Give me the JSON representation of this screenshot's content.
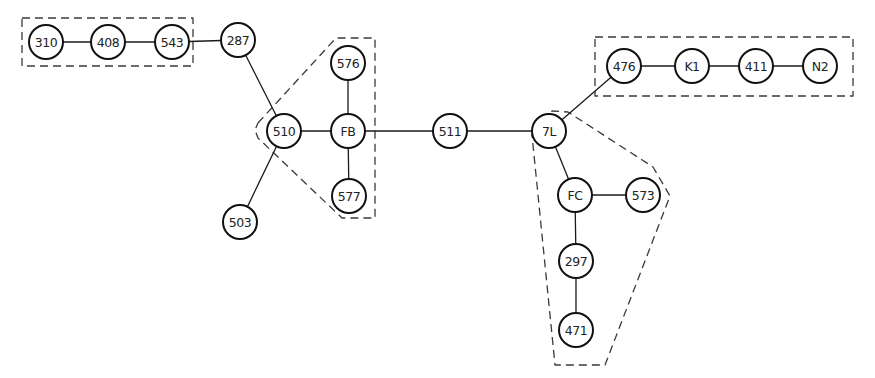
{
  "diagram": {
    "type": "network-graph",
    "node_radius": 17,
    "nodes": [
      {
        "id": "310",
        "label": "310",
        "x": 46,
        "y": 42
      },
      {
        "id": "408",
        "label": "408",
        "x": 108,
        "y": 42
      },
      {
        "id": "543",
        "label": "543",
        "x": 172,
        "y": 42
      },
      {
        "id": "287",
        "label": "287",
        "x": 238,
        "y": 40
      },
      {
        "id": "510",
        "label": "510",
        "x": 284,
        "y": 131
      },
      {
        "id": "503",
        "label": "503",
        "x": 240,
        "y": 222
      },
      {
        "id": "FB",
        "label": "FB",
        "x": 348,
        "y": 131
      },
      {
        "id": "576",
        "label": "576",
        "x": 348,
        "y": 63
      },
      {
        "id": "577",
        "label": "577",
        "x": 349,
        "y": 196
      },
      {
        "id": "511",
        "label": "511",
        "x": 450,
        "y": 131
      },
      {
        "id": "7L",
        "label": "7L",
        "x": 549,
        "y": 131
      },
      {
        "id": "476",
        "label": "476",
        "x": 624,
        "y": 66
      },
      {
        "id": "K1",
        "label": "K1",
        "x": 692,
        "y": 66
      },
      {
        "id": "411",
        "label": "411",
        "x": 756,
        "y": 66
      },
      {
        "id": "N2",
        "label": "N2",
        "x": 820,
        "y": 66
      },
      {
        "id": "FC",
        "label": "FC",
        "x": 575,
        "y": 195
      },
      {
        "id": "573",
        "label": "573",
        "x": 643,
        "y": 195
      },
      {
        "id": "297",
        "label": "297",
        "x": 576,
        "y": 261
      },
      {
        "id": "471",
        "label": "471",
        "x": 576,
        "y": 330
      }
    ],
    "edges": [
      [
        "310",
        "408"
      ],
      [
        "408",
        "543"
      ],
      [
        "543",
        "287"
      ],
      [
        "287",
        "510"
      ],
      [
        "510",
        "503"
      ],
      [
        "510",
        "FB"
      ],
      [
        "FB",
        "576"
      ],
      [
        "FB",
        "577"
      ],
      [
        "FB",
        "511"
      ],
      [
        "511",
        "7L"
      ],
      [
        "7L",
        "476"
      ],
      [
        "476",
        "K1"
      ],
      [
        "K1",
        "411"
      ],
      [
        "411",
        "N2"
      ],
      [
        "7L",
        "FC"
      ],
      [
        "FC",
        "573"
      ],
      [
        "FC",
        "297"
      ],
      [
        "297",
        "471"
      ]
    ],
    "groups": [
      {
        "id": "group-top-left",
        "members": [
          "310",
          "408",
          "543"
        ],
        "points": "22,18 193,18 193,66 22,66"
      },
      {
        "id": "group-fb",
        "members": [
          "510",
          "FB",
          "576",
          "577"
        ],
        "points": "258,123 336,38 375,38 375,218 342,218 258,138 255,130"
      },
      {
        "id": "group-top-right",
        "members": [
          "476",
          "K1",
          "411",
          "N2"
        ],
        "points": "595,37 853,37 853,96 595,96"
      },
      {
        "id": "group-fc",
        "members": [
          "7L",
          "FC",
          "573",
          "297",
          "471"
        ],
        "points": "540,118 552,111 568,112 653,167 670,196 605,365 555,365 532,135"
      }
    ]
  }
}
